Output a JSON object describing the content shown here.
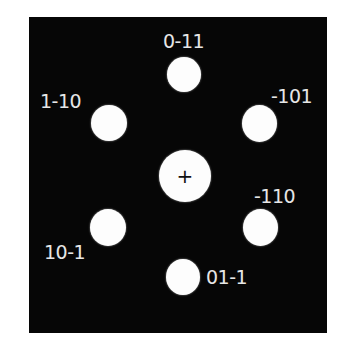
{
  "diagram": {
    "type": "diffraction-pattern",
    "background_color": "#060606",
    "spot_color": "#fdfdfd",
    "label_color": "#e6e6e6",
    "center": {
      "marker": "+"
    },
    "spots": [
      {
        "id": "0-11",
        "label": "0-11"
      },
      {
        "id": "1-10",
        "label": "1-10"
      },
      {
        "id": "-101",
        "label": "-101"
      },
      {
        "id": "10-1",
        "label": "10-1"
      },
      {
        "id": "-110",
        "label": "-110"
      },
      {
        "id": "01-1",
        "label": "01-1"
      }
    ]
  }
}
